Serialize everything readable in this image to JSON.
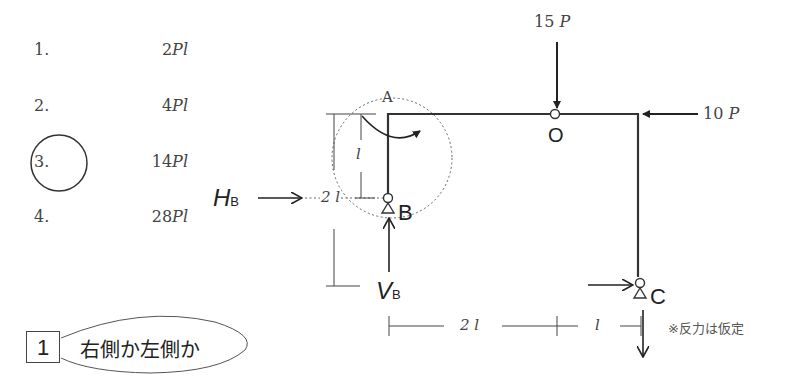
{
  "choices": [
    {
      "number": "1.",
      "value": "2",
      "unit": "Pl"
    },
    {
      "number": "2.",
      "value": "4",
      "unit": "Pl"
    },
    {
      "number": "3.",
      "value": "14",
      "unit": "Pl",
      "circled": true
    },
    {
      "number": "4.",
      "value": "28",
      "unit": "Pl"
    }
  ],
  "tag": {
    "number": "1",
    "text": "右側か左側か"
  },
  "diagram": {
    "loads": {
      "vertical": {
        "value": "15",
        "unit": "P"
      },
      "horizontal": {
        "value": "10",
        "unit": "P"
      }
    },
    "nodes": {
      "A": "A",
      "O": "O",
      "B": "B",
      "C": "C"
    },
    "reactions": {
      "HB_main": "H",
      "HB_sub": "B",
      "VB_main": "V",
      "VB_sub": "B"
    },
    "dimensions": {
      "height_total": "2 l",
      "height_partial": "l",
      "width_left": "2 l",
      "width_right": "l"
    },
    "note": "※反力は仮定"
  }
}
